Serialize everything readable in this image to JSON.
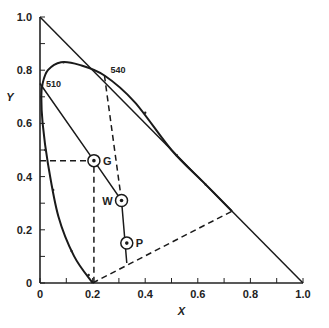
{
  "chart_data": {
    "type": "line",
    "title": "",
    "xlabel": "X",
    "ylabel": "Y",
    "xlim": [
      0,
      1.0
    ],
    "ylim": [
      0,
      1.0
    ],
    "x_ticks": [
      "0",
      "0.2",
      "0.4",
      "0.6",
      "0.8",
      "1.0"
    ],
    "y_ticks": [
      "0",
      "0.2",
      "0.4",
      "0.6",
      "0.8",
      "1.0"
    ],
    "grid": false,
    "legend": null,
    "series": [
      {
        "name": "spectral locus",
        "style": "solid",
        "points": [
          [
            0.2,
            0.0
          ],
          [
            0.13,
            0.1
          ],
          [
            0.07,
            0.25
          ],
          [
            0.03,
            0.45
          ],
          [
            0.01,
            0.6
          ],
          [
            0.005,
            0.7
          ],
          [
            0.01,
            0.75
          ],
          [
            0.03,
            0.8
          ],
          [
            0.08,
            0.83
          ],
          [
            0.15,
            0.82
          ],
          [
            0.245,
            0.78
          ],
          [
            0.36,
            0.68
          ],
          [
            0.5,
            0.5
          ],
          [
            0.62,
            0.38
          ],
          [
            0.73,
            0.27
          ]
        ]
      },
      {
        "name": "triangle boundary x+y=1",
        "style": "solid",
        "points": [
          [
            0,
            1.0
          ],
          [
            1.0,
            0
          ]
        ]
      },
      {
        "name": "line 510-W-P",
        "style": "solid",
        "points": [
          [
            0.0,
            0.75
          ],
          [
            0.205,
            0.46
          ],
          [
            0.31,
            0.31
          ],
          [
            0.33,
            0.075
          ]
        ]
      },
      {
        "name": "dashed G projection",
        "style": "dashed",
        "points": [
          [
            0.0,
            0.46
          ],
          [
            0.205,
            0.46
          ],
          [
            0.205,
            0.0
          ]
        ]
      },
      {
        "name": "dashed 540 to W",
        "style": "dashed",
        "points": [
          [
            0.245,
            0.78
          ],
          [
            0.31,
            0.31
          ]
        ]
      },
      {
        "name": "dashed purple line",
        "style": "dashed",
        "points": [
          [
            0.2,
            0.0
          ],
          [
            0.73,
            0.27
          ]
        ]
      }
    ],
    "annotations": [
      {
        "text": "510",
        "x": 0.0,
        "y": 0.75
      },
      {
        "text": "540",
        "x": 0.245,
        "y": 0.78
      },
      {
        "text": "G",
        "x": 0.205,
        "y": 0.46
      },
      {
        "text": "W",
        "x": 0.31,
        "y": 0.31
      },
      {
        "text": "P",
        "x": 0.33,
        "y": 0.15
      }
    ]
  }
}
